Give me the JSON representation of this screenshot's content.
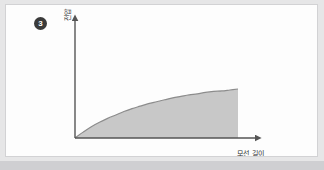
{
  "figure": {
    "marker_label": "3",
    "marker_glyph": "❶"
  },
  "colors": {
    "page_background": "#e6e6e7",
    "card_background": "#fdfdfd",
    "card_border": "#d2d2d4",
    "axis_line": "#555555",
    "curve_stroke": "#8c8c8c",
    "area_fill": "#c8c8c8",
    "marker_fill": "#3a3a3a",
    "marker_text": "#ffffff",
    "label_text": "#2d2d2d",
    "bottom_band": "#cfcfd2"
  },
  "chart_data": {
    "type": "area",
    "title": "",
    "subtitle": "",
    "xlabel": "모선 길이",
    "ylabel": "전압",
    "grid": false,
    "legend": null,
    "legend_position": "none",
    "xlim": [
      0,
      1
    ],
    "ylim": [
      0,
      1
    ],
    "x_tick_labels": [],
    "y_tick_labels": [],
    "annotations": [
      {
        "text": "❶",
        "role": "step-number-marker",
        "position": "top-left"
      }
    ],
    "series": [
      {
        "name": "전압",
        "x": [
          0.0,
          0.05,
          0.1,
          0.15,
          0.2,
          0.25,
          0.3,
          0.35,
          0.4,
          0.45,
          0.5,
          0.55,
          0.6,
          0.65,
          0.7,
          0.75,
          0.8,
          0.85,
          0.9,
          0.95,
          1.0
        ],
        "y": [
          0.0,
          0.12,
          0.23,
          0.32,
          0.4,
          0.47,
          0.54,
          0.6,
          0.65,
          0.7,
          0.74,
          0.78,
          0.82,
          0.85,
          0.88,
          0.9,
          0.93,
          0.95,
          0.96,
          0.98,
          1.0
        ]
      }
    ],
    "shape_description": "concave-increasing saturating curve rising from origin and flattening, with shaded area beneath, terminated by a vertical drop at the right end"
  }
}
